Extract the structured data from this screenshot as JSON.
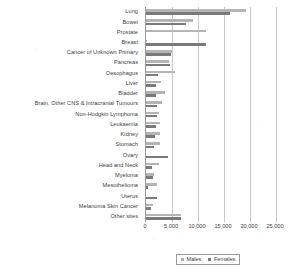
{
  "chart_data": {
    "type": "bar",
    "orientation": "horizontal",
    "title": "",
    "xlabel": "",
    "ylabel": "",
    "xlim": [
      0,
      25000
    ],
    "grid": true,
    "legend_position": "bottom",
    "xticks": [
      "0",
      "5,000",
      "10,000",
      "15,000",
      "20,000",
      "25,000"
    ],
    "xtick_values": [
      0,
      5000,
      10000,
      15000,
      20000,
      25000
    ],
    "categories": [
      "Lung",
      "Bowel",
      "Prostate",
      "Breast",
      "Cancer of Unknown Primary",
      "Pancreas",
      "Oesophagus",
      "Liver",
      "Bladder",
      "Brain, Other CNS & Intracranial Tumours",
      "Non-Hodgkin Lymphoma",
      "Leukaemia",
      "Kidney",
      "Stomach",
      "Ovary",
      "Head and Neck",
      "Myeloma",
      "Mesothelioma",
      "Uterus",
      "Melanoma Skin Cancer",
      "Other sites"
    ],
    "series": [
      {
        "name": "Males",
        "color": "#b4b4b4",
        "values": [
          19300,
          9100,
          11500,
          80,
          4950,
          4500,
          5500,
          2800,
          3700,
          3000,
          2500,
          2600,
          2700,
          2700,
          0,
          2500,
          1600,
          2100,
          0,
          1300,
          6700
        ]
      },
      {
        "name": "Females",
        "color": "#7a7a7a",
        "values": [
          16200,
          7600,
          0,
          11500,
          4800,
          4600,
          2300,
          2000,
          1900,
          2200,
          2200,
          2000,
          1800,
          1600,
          4200,
          1200,
          1400,
          400,
          2200,
          1000,
          6700
        ]
      }
    ]
  },
  "legend": {
    "items": [
      {
        "label": "Males"
      },
      {
        "label": "Females"
      }
    ]
  }
}
